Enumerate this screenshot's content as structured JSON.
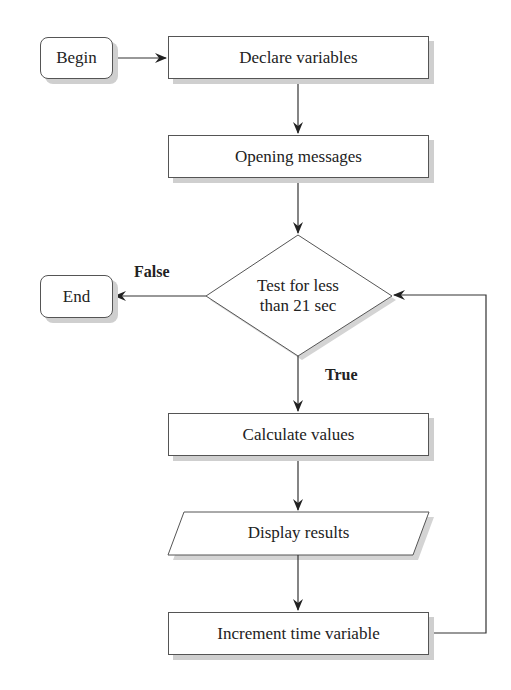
{
  "flowchart": {
    "nodes": {
      "begin": "Begin",
      "declare": "Declare variables",
      "opening": "Opening messages",
      "decision_line1": "Test for less",
      "decision_line2": "than 21 sec",
      "end": "End",
      "calculate": "Calculate values",
      "display": "Display results",
      "increment": "Increment time variable"
    },
    "edge_labels": {
      "false": "False",
      "true": "True"
    },
    "colors": {
      "stroke": "#555555",
      "shadow": "#cfcfcf",
      "background": "#ffffff"
    }
  }
}
